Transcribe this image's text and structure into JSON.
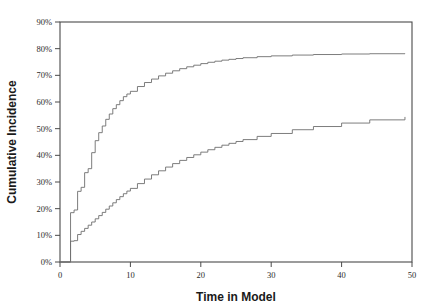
{
  "chart_data": {
    "type": "line",
    "title": "",
    "xlabel": "Time in Model",
    "ylabel": "Cumulative Incidence",
    "xlim": [
      0,
      50
    ],
    "ylim": [
      0,
      90
    ],
    "grid": false,
    "legend": "none",
    "xticks": [
      0,
      10,
      20,
      30,
      40,
      50
    ],
    "xtick_labels": [
      "0",
      "10",
      "20",
      "30",
      "40",
      "50"
    ],
    "yticks": [
      0,
      10,
      20,
      30,
      40,
      50,
      60,
      70,
      80,
      90
    ],
    "ytick_labels": [
      "0%",
      "10%",
      "20%",
      "30%",
      "40%",
      "50%",
      "60%",
      "70%",
      "80%",
      "90%"
    ],
    "series": [
      {
        "name": "upper-curve",
        "style": "step",
        "x": [
          0,
          1,
          1.5,
          2,
          2.5,
          3,
          3.5,
          4,
          4.5,
          5,
          5.5,
          6,
          6.5,
          7,
          7.5,
          8,
          8.5,
          9,
          9.5,
          10,
          11,
          12,
          13,
          14,
          15,
          16,
          17,
          18,
          19,
          20,
          21,
          22,
          23,
          24,
          25,
          26,
          28,
          30,
          33,
          36,
          40,
          44,
          49
        ],
        "values": [
          0,
          0,
          18.5,
          19.5,
          26.5,
          28.0,
          33.5,
          35.0,
          41.0,
          45.5,
          48.5,
          51.0,
          53.5,
          55.5,
          57.5,
          59.0,
          60.5,
          62.0,
          63.0,
          64.0,
          65.8,
          67.3,
          68.6,
          69.8,
          70.8,
          71.7,
          72.5,
          73.2,
          73.8,
          74.4,
          74.9,
          75.3,
          75.7,
          76.0,
          76.3,
          76.6,
          77.0,
          77.3,
          77.6,
          77.8,
          78.0,
          78.1,
          78.2
        ]
      },
      {
        "name": "lower-curve",
        "style": "step",
        "x": [
          0,
          1,
          1.5,
          2,
          2.5,
          3,
          3.5,
          4,
          4.5,
          5,
          5.5,
          6,
          6.5,
          7,
          7.5,
          8,
          8.5,
          9,
          9.5,
          10,
          11,
          12,
          13,
          14,
          15,
          16,
          17,
          18,
          19,
          20,
          21,
          22,
          23,
          24,
          25,
          26,
          28,
          30,
          33,
          36,
          40,
          44,
          49
        ],
        "values": [
          0,
          0,
          7.8,
          8.0,
          10.3,
          11.5,
          12.6,
          13.8,
          15.0,
          16.2,
          17.4,
          18.6,
          19.8,
          21.0,
          22.2,
          23.4,
          24.5,
          25.6,
          26.6,
          27.6,
          29.4,
          31.1,
          32.7,
          34.2,
          35.6,
          36.9,
          38.1,
          39.2,
          40.2,
          41.2,
          42.1,
          43.0,
          43.8,
          44.5,
          45.2,
          45.9,
          47.1,
          48.2,
          49.6,
          50.8,
          52.1,
          53.3,
          54.4
        ]
      }
    ]
  },
  "axes": {
    "x_title": "Time in Model",
    "y_title": "Cumulative Incidence"
  }
}
